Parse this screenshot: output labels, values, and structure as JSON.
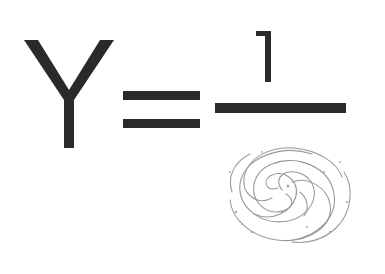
{
  "equation": {
    "lhs": "Y",
    "operator": "=",
    "numerator": "1",
    "denominator_icon": "galaxy-sketch-icon"
  },
  "colors": {
    "ink": "#2a2a2a",
    "sketch": "#9a9a9a",
    "background": "#ffffff"
  }
}
